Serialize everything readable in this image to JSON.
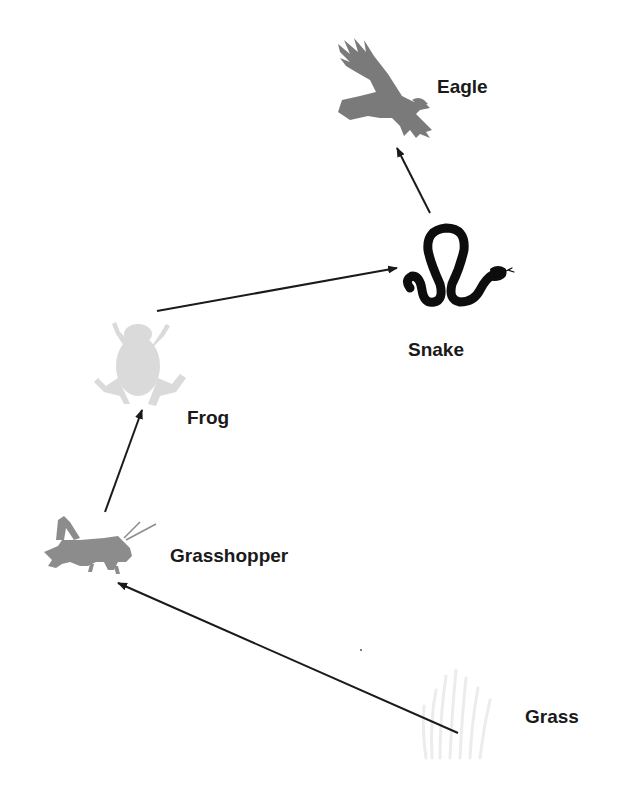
{
  "diagram": {
    "type": "food-chain",
    "nodes": [
      {
        "id": "eagle",
        "label": "Eagle",
        "icon": "eagle-icon",
        "color": "#7a7a7a"
      },
      {
        "id": "snake",
        "label": "Snake",
        "icon": "snake-icon",
        "color": "#0d0d0d"
      },
      {
        "id": "frog",
        "label": "Frog",
        "icon": "frog-icon",
        "color": "#d4d4d4"
      },
      {
        "id": "grasshopper",
        "label": "Grasshopper",
        "icon": "grasshopper-icon",
        "color": "#8c8c8c"
      },
      {
        "id": "grass",
        "label": "Grass",
        "icon": "grass-icon",
        "color": "#ececec"
      }
    ],
    "edges": [
      {
        "from": "grass",
        "to": "grasshopper"
      },
      {
        "from": "grasshopper",
        "to": "frog"
      },
      {
        "from": "frog",
        "to": "snake"
      },
      {
        "from": "snake",
        "to": "eagle"
      }
    ],
    "arrow_color": "#1a1a1a"
  }
}
